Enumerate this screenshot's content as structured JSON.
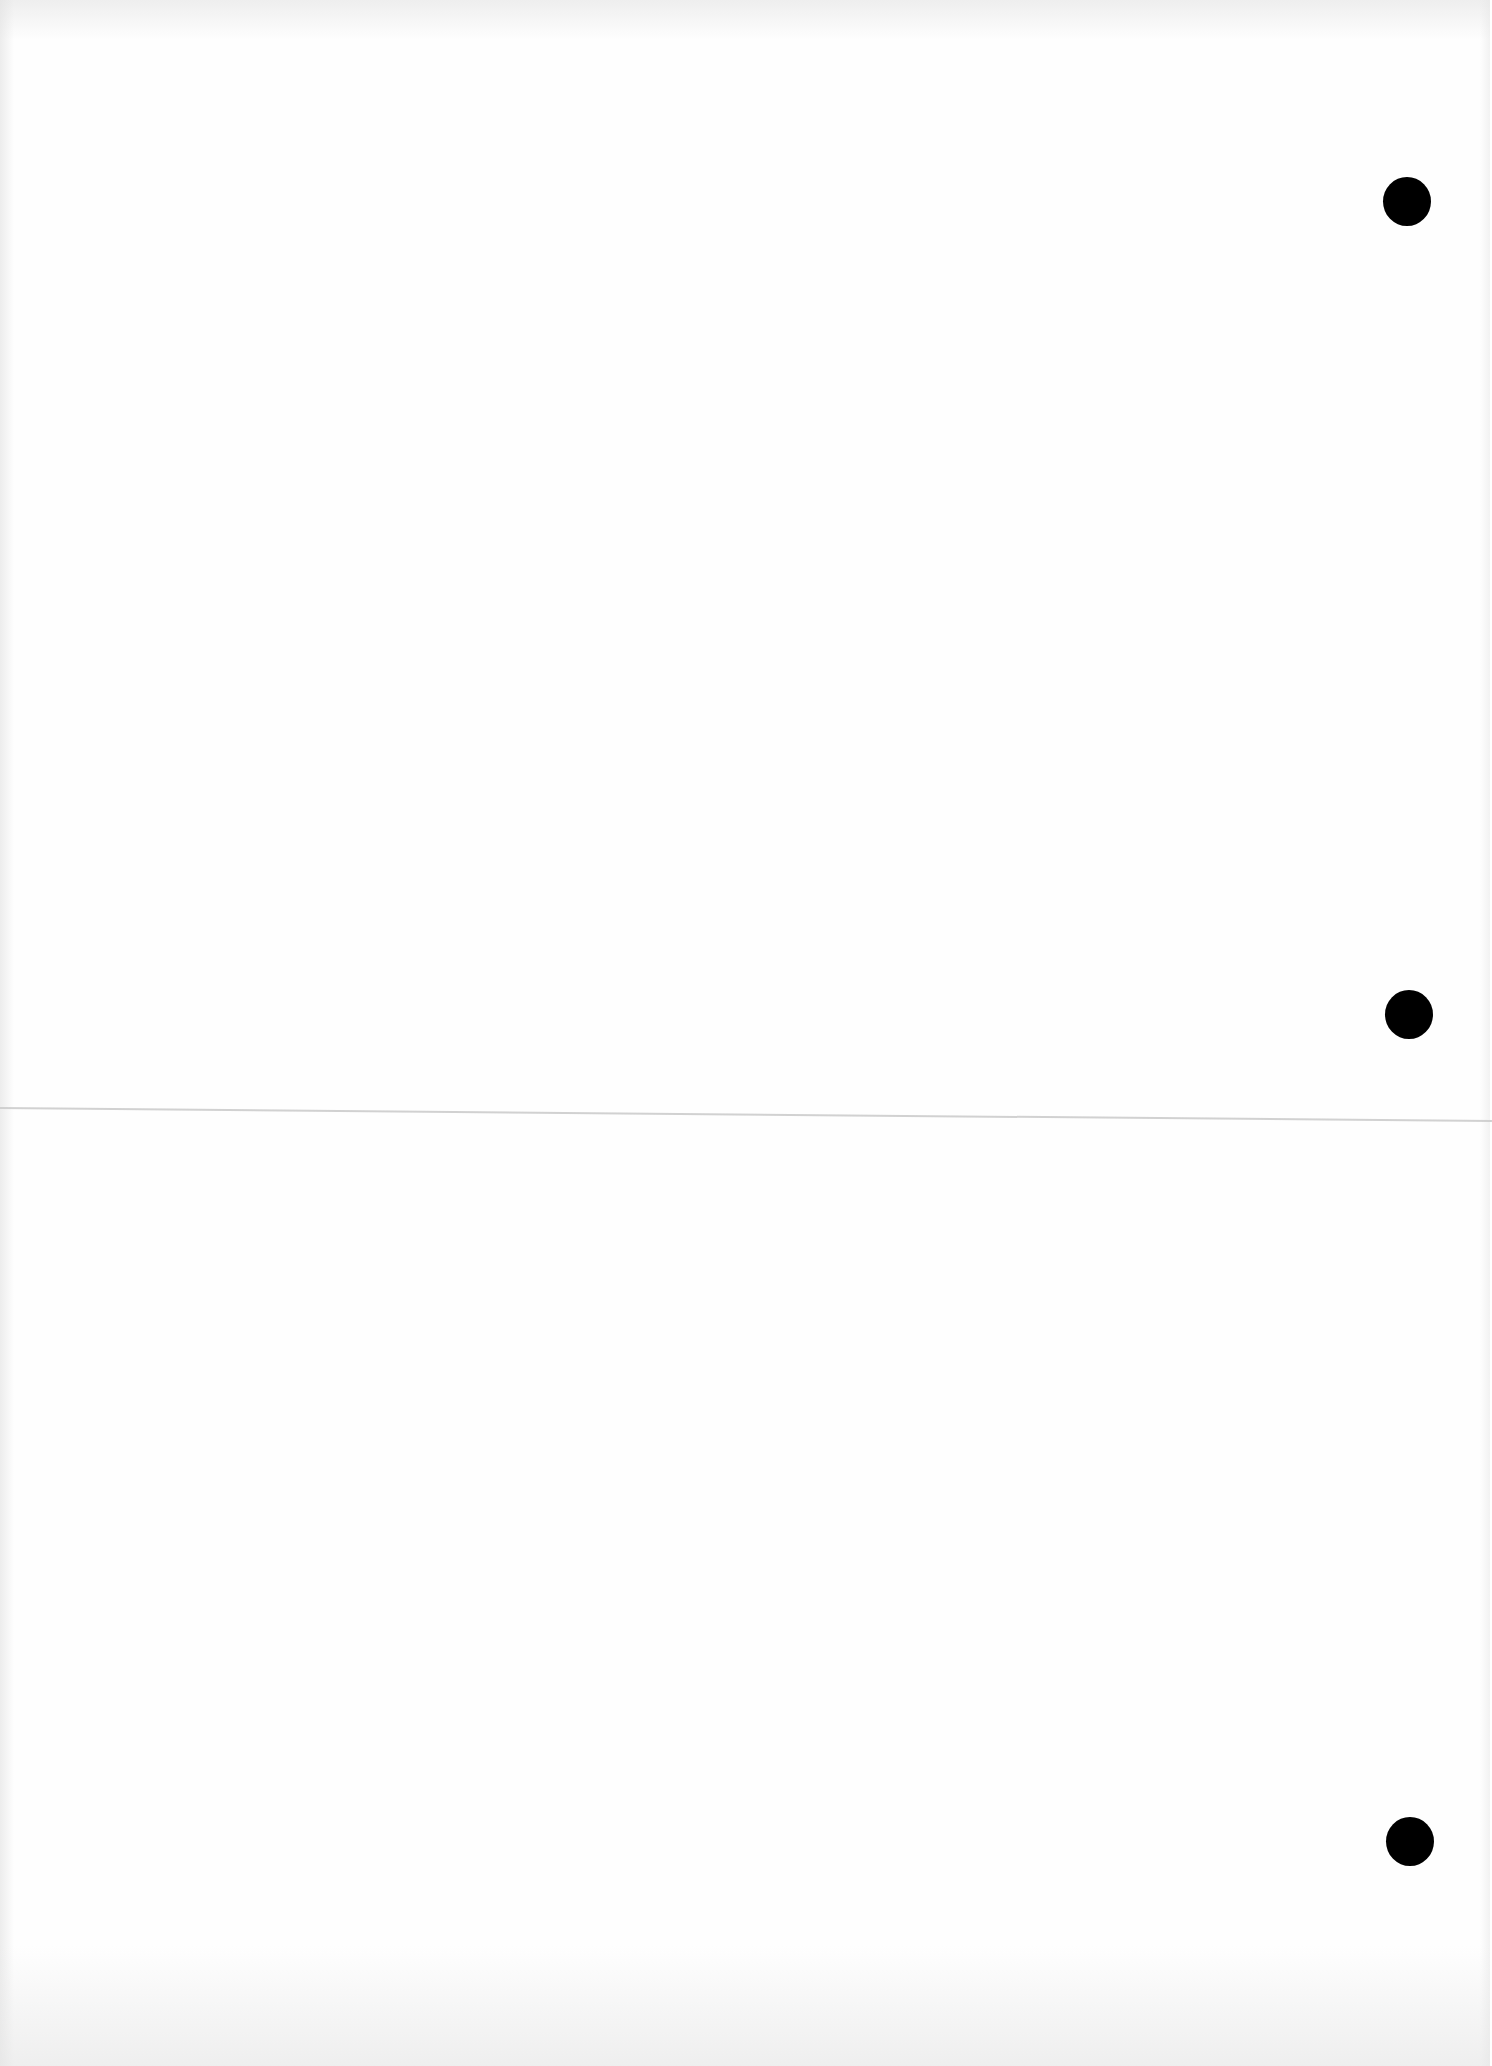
{
  "page": {
    "type": "blank-scanned-sheet",
    "paper_color": "#fefefe",
    "width": 1490,
    "height": 2066
  },
  "punch_holes": [
    {
      "cx": 1407,
      "cy": 201,
      "diameter": 48,
      "color": "#000000"
    },
    {
      "cx": 1409,
      "cy": 1014,
      "diameter": 48,
      "color": "#000000"
    },
    {
      "cx": 1410,
      "cy": 1841,
      "diameter": 48,
      "color": "#000000"
    }
  ],
  "fold_line": {
    "y_left": 1107,
    "y_right": 1120,
    "color": "#c9c9c9"
  }
}
